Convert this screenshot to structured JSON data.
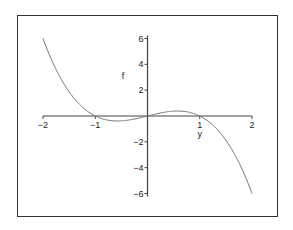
{
  "chart_data": {
    "type": "line",
    "title": "",
    "xlabel": "y",
    "ylabel": "f",
    "function": "f = y - y^3",
    "xlim": [
      -2,
      2
    ],
    "ylim": [
      -6,
      6
    ],
    "x_ticks": [
      -2,
      -1,
      1,
      2
    ],
    "x_tick_labels": [
      "−2",
      "−1",
      "1",
      "2"
    ],
    "y_ticks": [
      6,
      4,
      2,
      -2,
      -4,
      -6
    ],
    "y_tick_labels": [
      "6",
      "4",
      "2",
      "−2",
      "−4",
      "−6"
    ],
    "grid": false,
    "legend": null,
    "series": [
      {
        "name": "f",
        "x": [
          -2,
          -1.75,
          -1.5,
          -1.25,
          -1,
          -0.75,
          -0.577,
          -0.5,
          -0.25,
          0,
          0.25,
          0.5,
          0.577,
          0.75,
          1,
          1.25,
          1.5,
          1.75,
          2
        ],
        "y": [
          6,
          3.61,
          1.875,
          0.703,
          0,
          -0.328,
          -0.385,
          -0.375,
          -0.234,
          0,
          0.234,
          0.375,
          0.385,
          0.328,
          0,
          -0.703,
          -1.875,
          -3.61,
          -6
        ]
      }
    ]
  },
  "colors": {
    "curve": "#777777",
    "axes": "#444444",
    "frame": "#333333",
    "background": "#ffffff"
  }
}
